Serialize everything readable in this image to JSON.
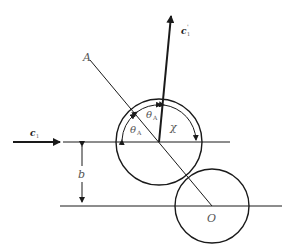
{
  "diagram": {
    "type": "collision geometry",
    "colors": {
      "stroke": "#1a1a1a",
      "label": "#555555"
    },
    "labels": {
      "point_a": "A",
      "origin": "O",
      "impact_parameter": "b",
      "chi": "χ",
      "theta_symbol": "θ",
      "theta_sub": "A",
      "incoming_velocity": "c",
      "incoming_velocity_sub": "1",
      "outgoing_velocity": "c",
      "outgoing_velocity_sub": "1",
      "outgoing_velocity_prime": "'"
    },
    "elements": {
      "upper_circle": {
        "cx": 159,
        "cy": 142,
        "r": 43
      },
      "lower_circle": {
        "cx": 212,
        "cy": 206,
        "r": 37
      },
      "upper_line": {
        "x1": 63,
        "x2": 230,
        "y": 142
      },
      "lower_line": {
        "x1": 60,
        "x2": 282,
        "y": 206
      },
      "apse_line": {
        "x1": 90,
        "y1": 60,
        "x2": 212,
        "y2": 206
      },
      "incoming_arrow": {
        "x1": 13,
        "y1": 142,
        "x2": 62,
        "y2": 142
      },
      "outgoing_arrow": {
        "x1": 159,
        "y1": 142,
        "x2": 172,
        "y2": 12
      },
      "impact_dimension": {
        "x": 82,
        "y1": 142,
        "y2": 206
      }
    }
  }
}
